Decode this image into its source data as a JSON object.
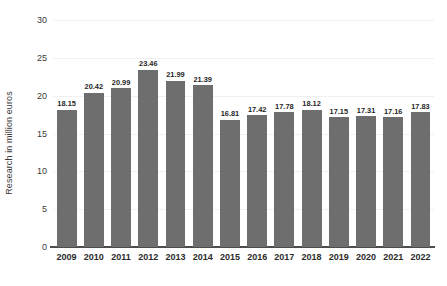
{
  "chart_data": {
    "type": "bar",
    "title": "",
    "subtitle": "",
    "xlabel": "",
    "ylabel": "Research in million euros",
    "categories": [
      "2009",
      "2010",
      "2011",
      "2012",
      "2013",
      "2014",
      "2015",
      "2016",
      "2017",
      "2018",
      "2019",
      "2020",
      "2021",
      "2022"
    ],
    "values": [
      18.15,
      20.42,
      20.99,
      23.46,
      21.99,
      21.39,
      16.81,
      17.42,
      17.78,
      18.12,
      17.15,
      17.31,
      17.16,
      17.83
    ],
    "value_labels": [
      "18.15",
      "20.42",
      "20.99",
      "23.46",
      "21.99",
      "21.39",
      "16.81",
      "17.42",
      "17.78",
      "18.12",
      "17.15",
      "17.31",
      "17.16",
      "17.83"
    ],
    "ylim": [
      0,
      30
    ],
    "yticks": [
      0,
      5,
      10,
      15,
      20,
      25,
      30
    ],
    "ytick_labels": [
      "0",
      "5",
      "10",
      "15",
      "20",
      "25",
      "30"
    ],
    "grid": true,
    "legend": null,
    "legend_position": "none",
    "bar_color": "#6e6e6e",
    "grid_color": "#f0f0f0",
    "axis_color": "#4d4d4d",
    "label_color": "#1f1f1f",
    "background_color": "#ffffff"
  }
}
